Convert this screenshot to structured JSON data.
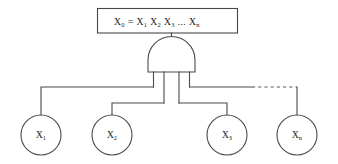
{
  "diagram": {
    "colors": {
      "line": "#4a4a4a",
      "text": "#1a1a1a",
      "background": "#ffffff",
      "dashed_line": "#5a5a5a"
    },
    "top_box": {
      "label_full": "X0 = X1 X2 X3 ... Xn",
      "base": "X",
      "sub": "0",
      "equals": "=",
      "terms": [
        {
          "base": "X",
          "sub": "1"
        },
        {
          "base": "X",
          "sub": "2"
        },
        {
          "base": "X",
          "sub": "3"
        }
      ],
      "ellipsis": "...",
      "last_term": {
        "base": "X",
        "sub": "n"
      }
    },
    "gate": {
      "type": "AND",
      "orientation": "inverted",
      "input_count": 4,
      "output_label": ""
    },
    "nodes": [
      {
        "id": "node-x1",
        "base": "X",
        "sub": "1",
        "cx": 41,
        "cy": 135,
        "r": 20
      },
      {
        "id": "node-x2",
        "base": "X",
        "sub": "2",
        "cx": 112,
        "cy": 135,
        "r": 20
      },
      {
        "id": "node-x3",
        "base": "X",
        "sub": "3",
        "cx": 227,
        "cy": 135,
        "r": 20
      },
      {
        "id": "node-xn",
        "base": "X",
        "sub": "n",
        "cx": 297,
        "cy": 135,
        "r": 20
      }
    ],
    "connectors": {
      "has_dashed_continuation": true,
      "dashed_meaning": "continuation"
    }
  }
}
